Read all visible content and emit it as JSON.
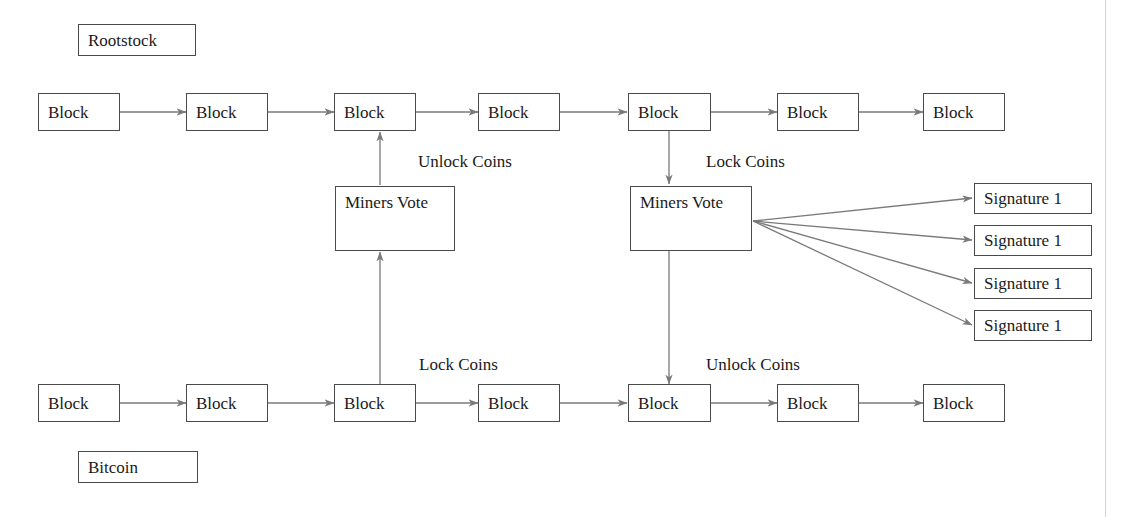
{
  "diagram": {
    "stroke_color": "#4a4a4a",
    "wire_color": "#7a7a7a",
    "text_color": "#1a1a1a",
    "background_color": "#ffffff",
    "page_rule_color": "#d2d2d2"
  },
  "chain_tags": {
    "rootstock": "Rootstock",
    "bitcoin": "Bitcoin"
  },
  "rootstock_chain": {
    "name": "Rootstock",
    "blocks": [
      {
        "label": "Block"
      },
      {
        "label": "Block"
      },
      {
        "label": "Block"
      },
      {
        "label": "Block"
      },
      {
        "label": "Block"
      },
      {
        "label": "Block"
      },
      {
        "label": "Block"
      }
    ]
  },
  "bitcoin_chain": {
    "name": "Bitcoin",
    "blocks": [
      {
        "label": "Block"
      },
      {
        "label": "Block"
      },
      {
        "label": "Block"
      },
      {
        "label": "Block"
      },
      {
        "label": "Block"
      },
      {
        "label": "Block"
      },
      {
        "label": "Block"
      }
    ]
  },
  "miners_vote": {
    "left": {
      "label": "Miners Vote"
    },
    "right": {
      "label": "Miners Vote"
    }
  },
  "edge_labels": {
    "unlock_coins_top": "Unlock Coins",
    "lock_coins_top": "Lock Coins",
    "lock_coins_bottom": "Lock Coins",
    "unlock_coins_bottom": "Unlock Coins"
  },
  "signatures": [
    {
      "label": "Signature 1"
    },
    {
      "label": "Signature 1"
    },
    {
      "label": "Signature 1"
    },
    {
      "label": "Signature 1"
    }
  ]
}
